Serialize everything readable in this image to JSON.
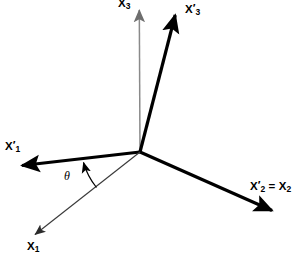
{
  "diagram": {
    "type": "axis-rotation-diagram",
    "background_color": "#ffffff",
    "origin": {
      "x": 140,
      "y": 152
    },
    "labels": {
      "x3": {
        "base": "X",
        "sub": "3",
        "prime": ""
      },
      "x3p": {
        "base": "X",
        "sub": "3",
        "prime": "′"
      },
      "x1p": {
        "base": "X",
        "sub": "1",
        "prime": "′"
      },
      "x1": {
        "base": "X",
        "sub": "1",
        "prime": ""
      },
      "x2p": {
        "base": "X",
        "sub": "2",
        "prime": "′"
      },
      "x2": {
        "base": "X",
        "sub": "2",
        "prime": ""
      },
      "equals": " = ",
      "theta": "θ"
    },
    "axes": [
      {
        "name": "X3",
        "style": "thin",
        "color": "#808080",
        "width": 1.4,
        "from": {
          "x": 140,
          "y": 152
        },
        "to": {
          "x": 139,
          "y": 8
        },
        "arrow": "end",
        "label_text": "X3"
      },
      {
        "name": "X3-prime",
        "style": "thick",
        "color": "#000000",
        "width": 3.2,
        "from": {
          "x": 140,
          "y": 152
        },
        "to": {
          "x": 176,
          "y": 12
        },
        "arrow": "end",
        "label_text": "X'3"
      },
      {
        "name": "X1-prime",
        "style": "thick",
        "color": "#000000",
        "width": 3.2,
        "from": {
          "x": 140,
          "y": 152
        },
        "to": {
          "x": 18,
          "y": 166
        },
        "arrow": "end",
        "label_text": "X'1"
      },
      {
        "name": "X2-prime-equals-X2",
        "style": "thick",
        "color": "#000000",
        "width": 3.2,
        "from": {
          "x": 140,
          "y": 152
        },
        "to": {
          "x": 277,
          "y": 213
        },
        "arrow": "end",
        "label_text": "X'2 = X2"
      },
      {
        "name": "X1",
        "style": "thin",
        "color": "#555555",
        "width": 1.2,
        "from": {
          "x": 140,
          "y": 152
        },
        "to": {
          "x": 31,
          "y": 238
        },
        "arrow": "end",
        "label_text": "X1"
      }
    ],
    "angle_arc": {
      "name": "theta-arc",
      "symbol": "θ",
      "between": [
        "X1",
        "X1-prime"
      ],
      "color": "#000000",
      "width": 1.2,
      "arrow": "end",
      "radius": 70
    }
  }
}
